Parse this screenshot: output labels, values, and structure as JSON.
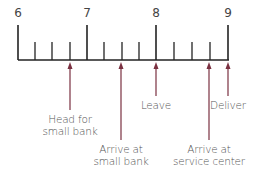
{
  "timeline": {
    "hours": [
      {
        "label": "6",
        "x": 18
      },
      {
        "label": "7",
        "x": 87
      },
      {
        "label": "8",
        "x": 156
      },
      {
        "label": "9",
        "x": 228
      }
    ],
    "minor_ticks_x": [
      35,
      52,
      70,
      104,
      122,
      139,
      174,
      192,
      210
    ],
    "line_color": "#222222",
    "arrow_color": "#7a3040"
  },
  "events": [
    {
      "label_line1": "Head for",
      "label_line2": "small bank",
      "x": 70,
      "arrow_end_y": 110,
      "label_y": 113
    },
    {
      "label_line1": "Arrive at",
      "label_line2": "small bank",
      "x": 121,
      "arrow_end_y": 140,
      "label_y": 143
    },
    {
      "label_line1": "Leave",
      "label_line2": "",
      "x": 156,
      "arrow_end_y": 96,
      "label_y": 99
    },
    {
      "label_line1": "Arrive at",
      "label_line2": "service center",
      "x": 209,
      "arrow_end_y": 140,
      "label_y": 143
    },
    {
      "label_line1": "Deliver",
      "label_line2": "",
      "x": 228,
      "arrow_end_y": 96,
      "label_y": 99
    }
  ]
}
